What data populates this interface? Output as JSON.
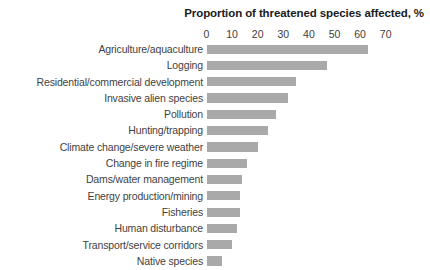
{
  "chart_data": {
    "type": "bar",
    "orientation": "horizontal",
    "title": "Proportion of threatened species affected, %",
    "xlabel": "",
    "ylabel": "",
    "xlim": [
      0,
      70
    ],
    "xticks": [
      0,
      10,
      20,
      30,
      40,
      50,
      60,
      70
    ],
    "grid": false,
    "legend": "none",
    "bar_color": "#a9a9a9",
    "categories": [
      "Agriculture/aquaculture",
      "Logging",
      "Residential/commercial development",
      "Invasive alien species",
      "Pollution",
      "Hunting/trapping",
      "Climate change/severe weather",
      "Change in fire regime",
      "Dams/water management",
      "Energy production/mining",
      "Fisheries",
      "Human disturbance",
      "Transport/service corridors",
      "Native species"
    ],
    "values": [
      63,
      47,
      35,
      32,
      27,
      24,
      20,
      16,
      14,
      13,
      13,
      12,
      10,
      6
    ]
  }
}
